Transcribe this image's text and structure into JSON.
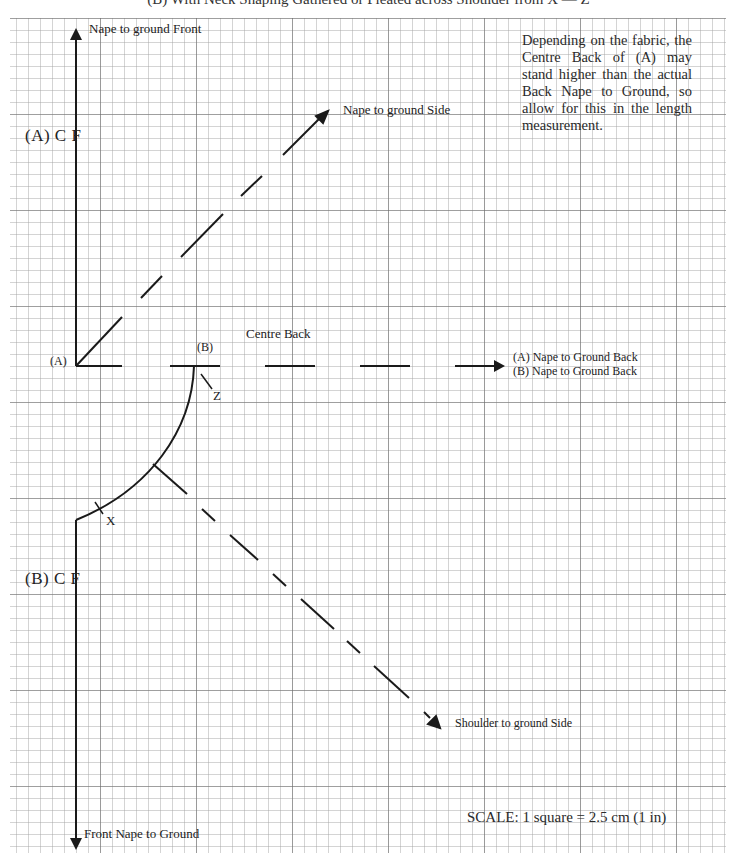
{
  "title": "(B) With Neck Shaping Gathered or Pleated across Shoulder from X — Z",
  "grid": {
    "square_px": 12,
    "line_color": "#9a9a9a",
    "major_line_color": "#6e6e6e",
    "ink_color": "#1a1a1a"
  },
  "labels": {
    "nape_front": "Nape to ground Front",
    "nape_side": "Nape to ground Side",
    "a_cf": "(A) C  F",
    "b_cf": "(B) C  F",
    "a_point": "(A)",
    "b_point": "(B)",
    "centre_back": "Centre Back",
    "a_back": "(A)  Nape to Ground Back",
    "b_back": "(B)  Nape to Ground Back",
    "z_mark": "Z",
    "x_mark": "X",
    "shoulder_side": "Shoulder to ground Side",
    "front_nape": "Front Nape to Ground"
  },
  "note": "Depending on the fabric, the Centre Back of (A) may stand higher than the actual Back Nape to Ground, so allow for this in the length measurement.",
  "scale": "SCALE:   1 square = 2.5 cm (1 in)"
}
